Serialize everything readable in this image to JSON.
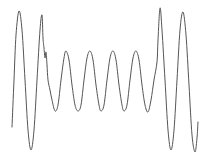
{
  "chart_data": {
    "type": "line",
    "title": "",
    "xlabel": "",
    "ylabel": "",
    "grid": false,
    "axes_visible": false,
    "legend": null,
    "line_color": "#555555",
    "line_width": 1,
    "points_px": [
      [
        12,
        127
      ],
      [
        14,
        80
      ],
      [
        16,
        35
      ],
      [
        19,
        11
      ],
      [
        22,
        30
      ],
      [
        25,
        80
      ],
      [
        28,
        130
      ],
      [
        31,
        150
      ],
      [
        34,
        130
      ],
      [
        37,
        80
      ],
      [
        40,
        30
      ],
      [
        42,
        15
      ],
      [
        43,
        38
      ],
      [
        44,
        48
      ],
      [
        45,
        58
      ],
      [
        46,
        52
      ],
      [
        47,
        65
      ],
      [
        48,
        80
      ],
      [
        50,
        90
      ],
      [
        52,
        100
      ],
      [
        55,
        111
      ],
      [
        58,
        105
      ],
      [
        61,
        80
      ],
      [
        64,
        58
      ],
      [
        66,
        51
      ],
      [
        69,
        60
      ],
      [
        72,
        85
      ],
      [
        75,
        105
      ],
      [
        78,
        111
      ],
      [
        81,
        105
      ],
      [
        84,
        80
      ],
      [
        87,
        58
      ],
      [
        90,
        51
      ],
      [
        93,
        60
      ],
      [
        96,
        85
      ],
      [
        99,
        105
      ],
      [
        101,
        111
      ],
      [
        104,
        105
      ],
      [
        107,
        80
      ],
      [
        110,
        58
      ],
      [
        113,
        51
      ],
      [
        116,
        60
      ],
      [
        119,
        85
      ],
      [
        122,
        105
      ],
      [
        124,
        111
      ],
      [
        127,
        105
      ],
      [
        130,
        80
      ],
      [
        133,
        58
      ],
      [
        136,
        51
      ],
      [
        139,
        60
      ],
      [
        142,
        85
      ],
      [
        145,
        105
      ],
      [
        148,
        112
      ],
      [
        151,
        100
      ],
      [
        154,
        80
      ],
      [
        157,
        62
      ],
      [
        158,
        40
      ],
      [
        160,
        8
      ],
      [
        162,
        30
      ],
      [
        165,
        80
      ],
      [
        168,
        130
      ],
      [
        171,
        150
      ],
      [
        174,
        130
      ],
      [
        177,
        80
      ],
      [
        180,
        30
      ],
      [
        183,
        12
      ],
      [
        186,
        35
      ],
      [
        189,
        85
      ],
      [
        192,
        135
      ],
      [
        195,
        152
      ],
      [
        197,
        138
      ],
      [
        198,
        122
      ]
    ]
  }
}
